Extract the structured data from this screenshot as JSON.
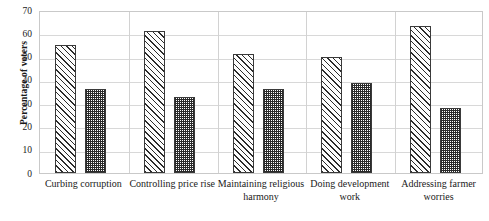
{
  "chart_data": {
    "type": "bar",
    "title": "",
    "xlabel": "",
    "ylabel": "Percentage of voters",
    "ylim": [
      0,
      70
    ],
    "yticks": [
      0,
      10,
      20,
      30,
      40,
      50,
      60,
      70
    ],
    "grid": true,
    "legend": null,
    "categories": [
      "Curbing corruption",
      "Controlling price rise",
      "Maintaining religious harmony",
      "Doing development work",
      "Addressing farmer worries"
    ],
    "series": [
      {
        "name": "Series 1",
        "pattern": "diagonal-hatch",
        "values": [
          55,
          61,
          51,
          50,
          63
        ]
      },
      {
        "name": "Series 2",
        "pattern": "checkered",
        "values": [
          36,
          32.5,
          36,
          38.5,
          28
        ]
      }
    ]
  },
  "axis": {
    "y_title": "Percentage of voters",
    "tick_labels": [
      "70",
      "60",
      "50",
      "40",
      "30",
      "20",
      "10",
      "0"
    ]
  },
  "colors": {
    "frame": "#c9c9c9",
    "grid": "#d8d8d8",
    "bar_outline": "#3a3a3a",
    "pattern_ink": "#2b2b2b",
    "background": "#ffffff"
  }
}
